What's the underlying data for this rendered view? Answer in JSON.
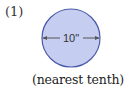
{
  "problem": {
    "number_label": "(1)",
    "caption": "(nearest tenth)"
  },
  "figure": {
    "shape": "circle",
    "dimension_label": "10\"",
    "dimension_type": "diameter",
    "fill_color": "#c5cdf0",
    "stroke_color": "#4a5aa8",
    "arrow_color": "#555555"
  }
}
